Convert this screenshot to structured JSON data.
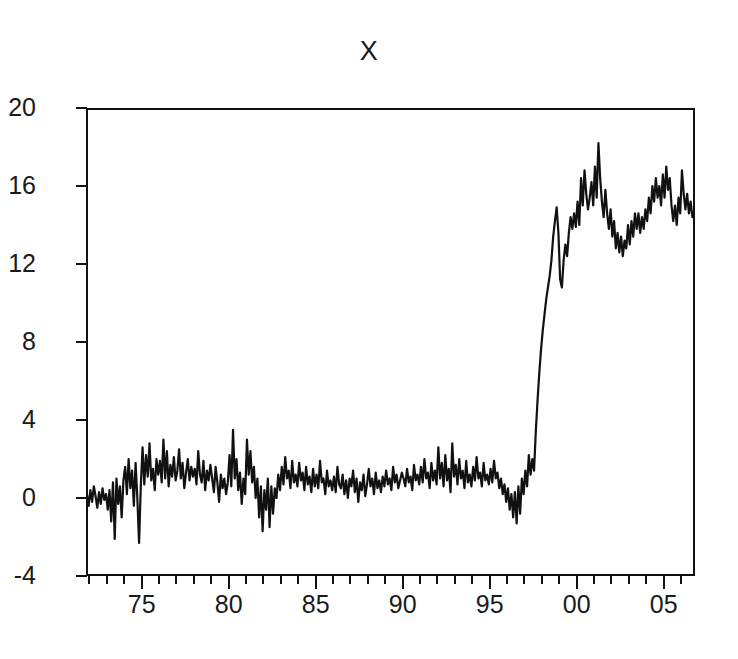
{
  "chart_data": {
    "type": "line",
    "title": "X",
    "xlabel": "",
    "ylabel": "",
    "xlim": [
      1971.8,
      2006.8
    ],
    "ylim": [
      -4,
      20
    ],
    "grid": false,
    "legend": "none",
    "line_color": "#111111",
    "background_color": "#ffffff",
    "axis_color": "#111111",
    "y_ticks": [
      20,
      16,
      12,
      8,
      4,
      0,
      -4
    ],
    "y_tick_labels": [
      "20",
      "16",
      "12",
      "8",
      "4",
      "0",
      "-4"
    ],
    "x_ticks": [
      1975,
      1980,
      1985,
      1990,
      1995,
      2000,
      2005
    ],
    "x_tick_labels": [
      "75",
      "80",
      "85",
      "90",
      "95",
      "00",
      "05"
    ],
    "x_minor_tick_interval": 1,
    "series": [
      {
        "name": "X",
        "x": [
          1971.85,
          1971.95,
          1972.05,
          1972.15,
          1972.25,
          1972.35,
          1972.45,
          1972.55,
          1972.65,
          1972.75,
          1972.85,
          1972.95,
          1973.05,
          1973.15,
          1973.25,
          1973.35,
          1973.45,
          1973.55,
          1973.65,
          1973.75,
          1973.85,
          1973.95,
          1974.05,
          1974.15,
          1974.25,
          1974.35,
          1974.45,
          1974.55,
          1974.65,
          1974.75,
          1974.85,
          1974.95,
          1975.05,
          1975.15,
          1975.25,
          1975.35,
          1975.45,
          1975.55,
          1975.65,
          1975.75,
          1975.85,
          1975.95,
          1976.05,
          1976.15,
          1976.25,
          1976.35,
          1976.45,
          1976.55,
          1976.65,
          1976.75,
          1976.85,
          1976.95,
          1977.05,
          1977.15,
          1977.25,
          1977.35,
          1977.45,
          1977.55,
          1977.65,
          1977.75,
          1977.85,
          1977.95,
          1978.05,
          1978.15,
          1978.25,
          1978.35,
          1978.45,
          1978.55,
          1978.65,
          1978.75,
          1978.85,
          1978.95,
          1979.05,
          1979.15,
          1979.25,
          1979.35,
          1979.45,
          1979.55,
          1979.65,
          1979.75,
          1979.85,
          1979.95,
          1980.05,
          1980.15,
          1980.25,
          1980.35,
          1980.45,
          1980.55,
          1980.65,
          1980.75,
          1980.85,
          1980.95,
          1981.05,
          1981.15,
          1981.25,
          1981.35,
          1981.45,
          1981.55,
          1981.65,
          1981.75,
          1981.85,
          1981.95,
          1982.05,
          1982.15,
          1982.25,
          1982.35,
          1982.45,
          1982.55,
          1982.65,
          1982.75,
          1982.85,
          1982.95,
          1983.05,
          1983.15,
          1983.25,
          1983.35,
          1983.45,
          1983.55,
          1983.65,
          1983.75,
          1983.85,
          1983.95,
          1984.05,
          1984.15,
          1984.25,
          1984.35,
          1984.45,
          1984.55,
          1984.65,
          1984.75,
          1984.85,
          1984.95,
          1985.05,
          1985.15,
          1985.25,
          1985.35,
          1985.45,
          1985.55,
          1985.65,
          1985.75,
          1985.85,
          1985.95,
          1986.05,
          1986.15,
          1986.25,
          1986.35,
          1986.45,
          1986.55,
          1986.65,
          1986.75,
          1986.85,
          1986.95,
          1987.05,
          1987.15,
          1987.25,
          1987.35,
          1987.45,
          1987.55,
          1987.65,
          1987.75,
          1987.85,
          1987.95,
          1988.05,
          1988.15,
          1988.25,
          1988.35,
          1988.45,
          1988.55,
          1988.65,
          1988.75,
          1988.85,
          1988.95,
          1989.05,
          1989.15,
          1989.25,
          1989.35,
          1989.45,
          1989.55,
          1989.65,
          1989.75,
          1989.85,
          1989.95,
          1990.05,
          1990.15,
          1990.25,
          1990.35,
          1990.45,
          1990.55,
          1990.65,
          1990.75,
          1990.85,
          1990.95,
          1991.05,
          1991.15,
          1991.25,
          1991.35,
          1991.45,
          1991.55,
          1991.65,
          1991.75,
          1991.85,
          1991.95,
          1992.05,
          1992.15,
          1992.25,
          1992.35,
          1992.45,
          1992.55,
          1992.65,
          1992.75,
          1992.85,
          1992.95,
          1993.05,
          1993.15,
          1993.25,
          1993.35,
          1993.45,
          1993.55,
          1993.65,
          1993.75,
          1993.85,
          1993.95,
          1994.05,
          1994.15,
          1994.25,
          1994.35,
          1994.45,
          1994.55,
          1994.65,
          1994.75,
          1994.85,
          1994.95,
          1995.05,
          1995.15,
          1995.25,
          1995.35,
          1995.45,
          1995.55,
          1995.65,
          1995.75,
          1995.85,
          1995.95,
          1996.05,
          1996.15,
          1996.25,
          1996.35,
          1996.45,
          1996.55,
          1996.65,
          1996.75,
          1996.85,
          1996.95,
          1997.05,
          1997.15,
          1997.25,
          1997.35,
          1997.45,
          1997.55,
          1997.65,
          1997.75,
          1997.85,
          1997.95,
          1998.05,
          1998.15,
          1998.25,
          1998.35,
          1998.45,
          1998.55,
          1998.65,
          1998.75,
          1998.85,
          1998.95,
          1999.05,
          1999.15,
          1999.25,
          1999.35,
          1999.45,
          1999.55,
          1999.65,
          1999.75,
          1999.85,
          1999.95,
          2000.05,
          2000.15,
          2000.25,
          2000.35,
          2000.45,
          2000.55,
          2000.65,
          2000.75,
          2000.85,
          2000.95,
          2001.05,
          2001.15,
          2001.25,
          2001.35,
          2001.45,
          2001.55,
          2001.65,
          2001.75,
          2001.85,
          2001.95,
          2002.05,
          2002.15,
          2002.25,
          2002.35,
          2002.45,
          2002.55,
          2002.65,
          2002.75,
          2002.85,
          2002.95,
          2003.05,
          2003.15,
          2003.25,
          2003.35,
          2003.45,
          2003.55,
          2003.65,
          2003.75,
          2003.85,
          2003.95,
          2004.05,
          2004.15,
          2004.25,
          2004.35,
          2004.45,
          2004.55,
          2004.65,
          2004.75,
          2004.85,
          2004.95,
          2005.05,
          2005.15,
          2005.25,
          2005.35,
          2005.45,
          2005.55,
          2005.65,
          2005.75,
          2005.85,
          2005.95,
          2006.05,
          2006.15,
          2006.25,
          2006.35,
          2006.45,
          2006.55,
          2006.65,
          2006.75
        ],
        "values": [
          0.2,
          -0.4,
          0.4,
          -0.2,
          0.6,
          0.1,
          -0.5,
          0.3,
          -0.3,
          0.5,
          -0.1,
          0.2,
          -0.6,
          0.4,
          -1.2,
          0.8,
          -2.1,
          1.0,
          -0.3,
          0.6,
          -1.0,
          0.9,
          1.6,
          0.2,
          2.0,
          0.5,
          1.4,
          -0.4,
          1.8,
          0.0,
          -2.3,
          0.6,
          2.6,
          0.7,
          2.2,
          1.1,
          2.8,
          0.9,
          1.5,
          0.4,
          2.0,
          1.2,
          1.9,
          0.8,
          3.0,
          1.0,
          2.4,
          0.6,
          1.7,
          1.1,
          2.1,
          0.9,
          1.4,
          2.5,
          1.0,
          1.8,
          0.5,
          1.3,
          2.0,
          0.9,
          1.6,
          1.1,
          1.5,
          0.7,
          2.4,
          1.2,
          0.8,
          1.9,
          0.4,
          1.4,
          0.9,
          1.7,
          1.0,
          0.3,
          1.6,
          0.8,
          -0.2,
          1.2,
          0.5,
          1.0,
          0.2,
          0.8,
          2.2,
          0.6,
          3.5,
          1.0,
          2.0,
          0.4,
          1.3,
          -0.3,
          1.0,
          0.2,
          3.0,
          1.2,
          2.4,
          0.8,
          1.6,
          0.0,
          1.0,
          -1.0,
          0.6,
          -1.7,
          0.4,
          -0.6,
          1.0,
          -1.5,
          0.6,
          -0.8,
          0.5,
          0.0,
          1.2,
          0.4,
          1.6,
          0.7,
          2.1,
          1.0,
          1.4,
          0.5,
          1.9,
          0.8,
          1.2,
          0.6,
          1.8,
          0.9,
          1.3,
          0.4,
          1.6,
          0.7,
          1.1,
          0.3,
          1.5,
          0.6,
          1.2,
          0.5,
          1.9,
          0.8,
          1.0,
          0.2,
          1.4,
          0.6,
          0.9,
          0.4,
          1.1,
          0.3,
          1.6,
          0.7,
          0.5,
          1.2,
          0.2,
          0.9,
          0.0,
          1.0,
          0.6,
          1.4,
          0.3,
          1.0,
          -0.2,
          0.8,
          0.4,
          1.2,
          0.1,
          0.7,
          1.5,
          0.6,
          1.0,
          0.2,
          1.3,
          0.5,
          0.9,
          0.3,
          1.1,
          0.6,
          1.4,
          0.7,
          1.0,
          0.4,
          1.6,
          0.8,
          1.2,
          0.5,
          0.9,
          1.3,
          1.0,
          0.6,
          1.5,
          0.8,
          1.1,
          0.4,
          1.7,
          0.9,
          1.2,
          0.7,
          1.6,
          0.8,
          2.0,
          1.0,
          1.3,
          0.5,
          1.8,
          0.9,
          1.4,
          0.7,
          2.6,
          1.0,
          1.8,
          0.6,
          2.2,
          0.9,
          1.5,
          0.3,
          2.8,
          1.1,
          1.7,
          0.7,
          2.0,
          1.0,
          1.4,
          0.5,
          1.9,
          0.8,
          1.2,
          0.6,
          1.6,
          0.9,
          2.1,
          1.0,
          1.3,
          0.6,
          1.8,
          0.9,
          1.2,
          0.7,
          1.5,
          0.8,
          1.9,
          1.0,
          1.3,
          0.5,
          1.0,
          0.2,
          0.7,
          -0.2,
          0.5,
          -0.6,
          0.2,
          -1.0,
          0.3,
          -1.3,
          0.6,
          -0.8,
          1.0,
          0.2,
          1.4,
          0.6,
          2.2,
          1.2,
          2.0,
          1.4,
          3.4,
          5.0,
          6.4,
          7.6,
          8.6,
          9.4,
          10.2,
          10.8,
          11.4,
          12.2,
          13.4,
          14.2,
          14.9,
          13.6,
          11.2,
          10.8,
          12.2,
          13.0,
          12.4,
          13.6,
          14.4,
          13.8,
          14.6,
          13.9,
          15.2,
          14.0,
          16.4,
          15.0,
          16.8,
          15.6,
          14.8,
          15.4,
          16.2,
          15.0,
          17.0,
          15.4,
          18.2,
          16.4,
          15.2,
          14.4,
          15.8,
          14.6,
          13.8,
          14.8,
          13.4,
          14.2,
          12.8,
          13.6,
          12.6,
          13.4,
          12.4,
          13.2,
          12.8,
          14.0,
          13.0,
          14.2,
          13.4,
          14.6,
          13.8,
          14.6,
          13.6,
          14.4,
          13.8,
          14.8,
          14.2,
          15.4,
          14.6,
          16.0,
          15.2,
          16.4,
          15.4,
          16.0,
          15.0,
          16.6,
          15.4,
          17.0,
          15.8,
          16.4,
          15.0,
          14.2,
          15.0,
          14.0,
          15.4,
          14.6,
          16.8,
          15.6,
          14.8,
          15.6,
          14.6,
          15.2,
          14.4,
          14.6
        ]
      }
    ]
  },
  "axes": {
    "y_ticks": [
      {
        "label": "20",
        "value": 20
      },
      {
        "label": "16",
        "value": 16
      },
      {
        "label": "12",
        "value": 12
      },
      {
        "label": "8",
        "value": 8
      },
      {
        "label": "4",
        "value": 4
      },
      {
        "label": "0",
        "value": 0
      },
      {
        "label": "-4",
        "value": -4
      }
    ],
    "x_ticks": [
      {
        "label": "75",
        "value": 1975
      },
      {
        "label": "80",
        "value": 1980
      },
      {
        "label": "85",
        "value": 1985
      },
      {
        "label": "90",
        "value": 1990
      },
      {
        "label": "95",
        "value": 1995
      },
      {
        "label": "00",
        "value": 2000
      },
      {
        "label": "05",
        "value": 2005
      }
    ]
  }
}
